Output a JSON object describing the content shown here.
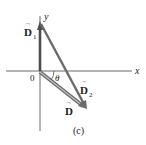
{
  "figure": {
    "caption": "(c)",
    "axes": {
      "x_label": "x",
      "y_label": "y",
      "origin_label": "0"
    },
    "vectors": [
      {
        "name": "D1",
        "label": "D",
        "subscript": "1",
        "from": [
          0,
          0
        ],
        "to": [
          0,
          47
        ],
        "color": "#555555"
      },
      {
        "name": "D2",
        "label": "D",
        "subscript": "2",
        "from": [
          0,
          47
        ],
        "to": [
          46,
          -37
        ],
        "color": "#666666"
      },
      {
        "name": "D",
        "label": "D",
        "subscript": "",
        "from": [
          0,
          0
        ],
        "to": [
          46,
          -37
        ],
        "color": "#777777"
      }
    ],
    "angle_label": "θ",
    "arrow_glyph": "→"
  }
}
